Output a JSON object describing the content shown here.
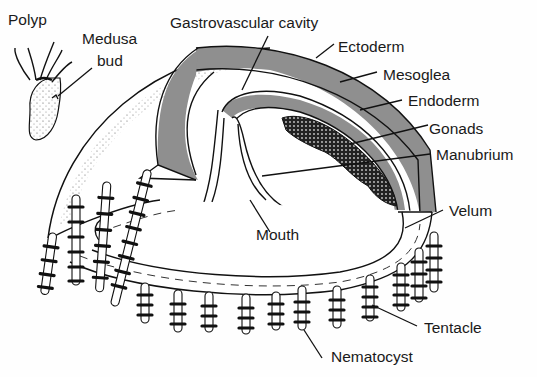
{
  "diagram": {
    "colors": {
      "ink": "#111111",
      "mesoglea_band": "#8f8f8f",
      "background": "#fefefe"
    },
    "labels": {
      "polyp": "Polyp",
      "medusa_bud_line1": "Medusa",
      "medusa_bud_line2": "bud",
      "gastrovascular_cavity": "Gastrovascular cavity",
      "ectoderm": "Ectoderm",
      "mesoglea": "Mesoglea",
      "endoderm": "Endoderm",
      "gonads": "Gonads",
      "manubrium": "Manubrium",
      "velum": "Velum",
      "mouth": "Mouth",
      "tentacle": "Tentacle",
      "nematocyst": "Nematocyst"
    }
  }
}
